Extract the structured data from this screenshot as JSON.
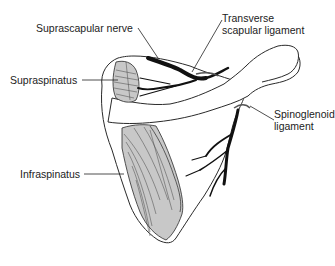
{
  "diagram": {
    "labels": {
      "suprascapular_nerve": "Suprascapular nerve",
      "transverse_line1": "Transverse",
      "transverse_line2": "scapular ligament",
      "supraspinatus": "Supraspinatus",
      "spinoglenoid_line1": "Spinoglenoid",
      "spinoglenoid_line2": "ligament",
      "infraspinatus": "Infraspinatus"
    },
    "colors": {
      "outline": "#2a2a2a",
      "muscle_fill": "#c8c8c8",
      "nerve": "#111111",
      "background": "#ffffff",
      "text": "#222222"
    }
  }
}
